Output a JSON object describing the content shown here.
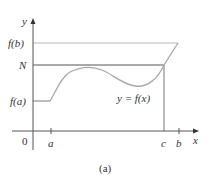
{
  "figure": {
    "caption": "(a)",
    "y_axis_label": "y",
    "x_axis_label": "x",
    "origin_label": "0",
    "y_ticks": {
      "fb": "f(b)",
      "N": "N",
      "fa": "f(a)"
    },
    "x_ticks": {
      "a": "a",
      "c": "c",
      "b": "b"
    },
    "curve_label": "y = f(x)",
    "colors": {
      "axis": "#555555",
      "curve": "#a8a8a8",
      "fb_line": "#b8b8b8",
      "N_line": "#555555"
    }
  }
}
